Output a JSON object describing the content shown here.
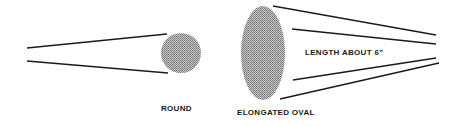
{
  "diagram": {
    "shapes": {
      "round": {
        "label": "ROUND",
        "fill": "#a9a9a9"
      },
      "oval": {
        "label": "ELONGATED OVAL",
        "fill": "#9a9a9a",
        "annotation": "LENGTH ABOUT 6\""
      }
    },
    "line_color": "#1a1a1a"
  }
}
